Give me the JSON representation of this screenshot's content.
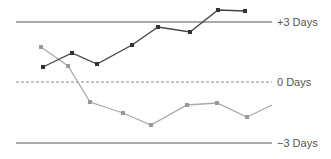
{
  "chart_data": {
    "type": "line",
    "title": "",
    "xlabel": "",
    "ylabel": "",
    "ylim": [
      -3.5,
      4.2
    ],
    "grid": false,
    "legend": null,
    "reference_lines": [
      {
        "value": 3,
        "label": "+3 Days",
        "style": "solid"
      },
      {
        "value": 0,
        "label": "0 Days",
        "style": "dashed"
      },
      {
        "value": -3,
        "label": "−3 Days",
        "style": "solid"
      }
    ],
    "series": [
      {
        "name": "dark-series",
        "color": "#444444",
        "markers": true,
        "x": [
          43,
          72,
          97,
          132,
          158,
          190,
          218,
          245
        ],
        "values": [
          0.75,
          1.45,
          0.9,
          1.85,
          2.75,
          2.5,
          3.6,
          3.55
        ]
      },
      {
        "name": "light-series",
        "color": "#aaaaaa",
        "markers": true,
        "x": [
          41,
          68,
          90,
          123,
          151,
          187,
          217,
          247,
          272
        ],
        "values": [
          1.75,
          0.8,
          -1.0,
          -1.55,
          -2.15,
          -1.15,
          -1.05,
          -1.75,
          -1.15
        ],
        "last_point_marker": false
      }
    ]
  },
  "labels": {
    "plus3": "+3 Days",
    "zero": "0 Days",
    "minus3": "−3 Days"
  }
}
